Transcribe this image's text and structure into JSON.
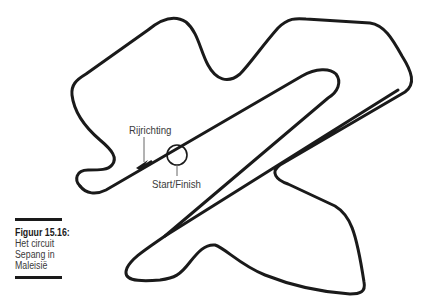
{
  "figure": {
    "number_label": "Figuur 15.16:",
    "caption_lines": [
      "Het circuit",
      "Sepang in",
      "Maleisië"
    ]
  },
  "annotations": {
    "direction": "Rijrichting",
    "start_finish": "Start/Finish"
  },
  "colors": {
    "track": "#1a1a1a",
    "annotation_line": "#666666",
    "text": "#3a3a3a"
  }
}
